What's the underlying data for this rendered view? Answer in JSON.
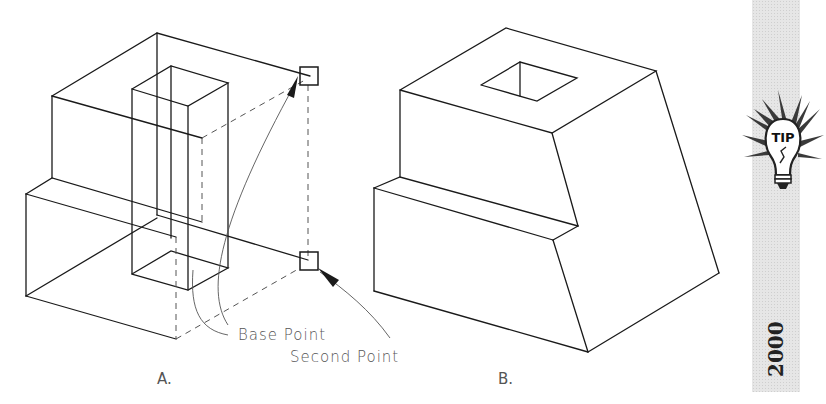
{
  "figure": {
    "panels": [
      {
        "id": "A",
        "label": "A.",
        "description": "Wireframe isometric block with rectangular column, showing move displacement"
      },
      {
        "id": "B",
        "label": "B.",
        "description": "Shaded-hidden isometric block with square hole on top and tapered front"
      }
    ],
    "annotations": {
      "base_point": "Base Point",
      "second_point": "Second Point"
    }
  },
  "sidebar": {
    "tip_icon_label": "TIP",
    "year": "2000",
    "background": "#e6e6e6"
  },
  "colors": {
    "line": "#1a1a1a",
    "annotation": "#555555",
    "background": "#ffffff"
  }
}
